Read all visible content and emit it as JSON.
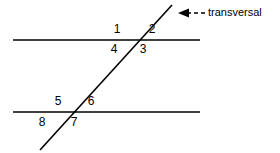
{
  "figure": {
    "background_color": "#ffffff",
    "stroke_color": "#000000",
    "width": 280,
    "height": 153
  },
  "lines": {
    "parallel_top": {
      "name": "upper parallel line",
      "x1": 13,
      "y1": 40,
      "x2": 200,
      "y2": 40
    },
    "parallel_bottom": {
      "name": "lower parallel line",
      "x1": 13,
      "y1": 112,
      "x2": 200,
      "y2": 112
    },
    "transversal": {
      "name": "transversal",
      "x1": 40,
      "y1": 150,
      "x2": 172,
      "y2": 5
    }
  },
  "intersections": {
    "upper": {
      "x": 137,
      "y": 40
    },
    "lower": {
      "x": 70,
      "y": 112
    }
  },
  "angles": [
    {
      "id": "angle-1",
      "label": "1",
      "x": 117,
      "y": 23,
      "position": "upper-left-above"
    },
    {
      "id": "angle-2",
      "label": "2",
      "x": 152,
      "y": 23,
      "position": "upper-right-above"
    },
    {
      "id": "angle-3",
      "label": "3",
      "x": 143,
      "y": 43,
      "position": "upper-right-below"
    },
    {
      "id": "angle-4",
      "label": "4",
      "x": 114,
      "y": 43,
      "position": "upper-left-below"
    },
    {
      "id": "angle-5",
      "label": "5",
      "x": 58,
      "y": 95,
      "position": "lower-left-above"
    },
    {
      "id": "angle-6",
      "label": "6",
      "x": 91,
      "y": 95,
      "position": "lower-right-above"
    },
    {
      "id": "angle-7",
      "label": "7",
      "x": 74,
      "y": 116,
      "position": "lower-right-below"
    },
    {
      "id": "angle-8",
      "label": "8",
      "x": 42,
      "y": 116,
      "position": "lower-left-below"
    }
  ],
  "callout": {
    "text": "transversal",
    "text_x": 208,
    "text_y": 6,
    "arrow": {
      "name": "dashed-arrow-left",
      "tip_x": 178,
      "tip_y": 13,
      "tail_x": 205,
      "tail_y": 13,
      "dash_pattern": "4,3"
    }
  }
}
